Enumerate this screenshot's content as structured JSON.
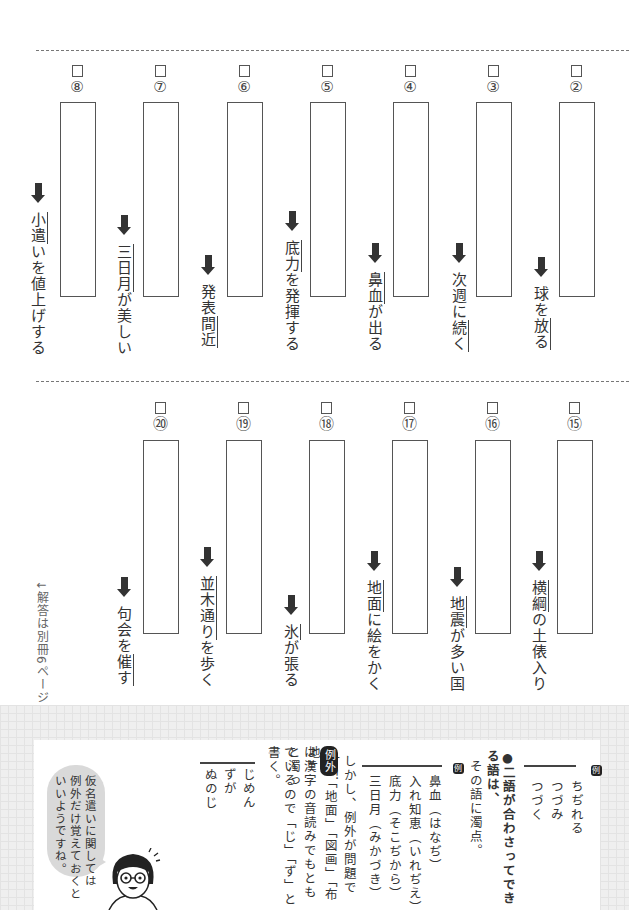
{
  "worksheet": {
    "row1": [
      {
        "num": "⑧",
        "label": "question-8",
        "pre": "小遣",
        "rest": "いを値上げする",
        "underline_first": true
      },
      {
        "num": "⑦",
        "label": "question-7",
        "pre": "三日月",
        "rest": "が美しい",
        "underline_first": true
      },
      {
        "num": "⑥",
        "label": "question-6",
        "pre": "発表",
        "mid": "間近",
        "rest": "",
        "underline_mid": true
      },
      {
        "num": "⑤",
        "label": "question-5",
        "pre": "底力",
        "rest": "を発揮する",
        "underline_first": true
      },
      {
        "num": "④",
        "label": "question-4",
        "pre": "鼻血",
        "rest": "が出る",
        "underline_first": true
      },
      {
        "num": "③",
        "label": "question-3",
        "pre": "次週に",
        "mid": "続く",
        "rest": "",
        "underline_mid": true
      },
      {
        "num": "②",
        "label": "question-2",
        "pre": "球を",
        "mid": "放る",
        "rest": "",
        "underline_mid": true
      }
    ],
    "row2": [
      {
        "num": "⑳",
        "label": "question-20",
        "pre": "句会を",
        "mid": "催す",
        "rest": ""
      },
      {
        "num": "⑲",
        "label": "question-19",
        "pre": "並木通り",
        "rest": "を歩く"
      },
      {
        "num": "⑱",
        "label": "question-18",
        "pre": "氷",
        "rest": "が張る"
      },
      {
        "num": "⑰",
        "label": "question-17",
        "pre": "地面",
        "rest": "に絵をかく"
      },
      {
        "num": "⑯",
        "label": "question-16",
        "pre": "地震",
        "rest": "が多い国"
      },
      {
        "num": "⑮",
        "label": "question-15",
        "pre": "横綱",
        "rest": "の土俵入り"
      }
    ],
    "answer_note": "↓解答は別冊6ページ"
  },
  "info": {
    "example_badge": "例",
    "example1": [
      "ちぢれる",
      "つづみ",
      "つづく"
    ],
    "rule_title": "●二語が合わさってできる語は、",
    "rule_cont": "その語に濁点。",
    "example2": [
      "鼻血（はなぢ）",
      "入れ知恵（いれぢえ）",
      "底力（そこぢから）",
      "三日月（みかづき）"
    ],
    "however": "しかし、例外が問題です！",
    "exception_badge": "例外",
    "exception_text": "「地面」「図画」「布地」",
    "exception_cont1": "は漢字の音読みでもともと濁っ",
    "exception_cont2": "ているので「じ」「ず」と書く。",
    "example3": [
      "じめん",
      "ずが",
      "ぬのじ"
    ],
    "bubble": [
      "仮名遣いに関しては",
      "例外だけ覚えておくと",
      "いいようですね。"
    ]
  }
}
